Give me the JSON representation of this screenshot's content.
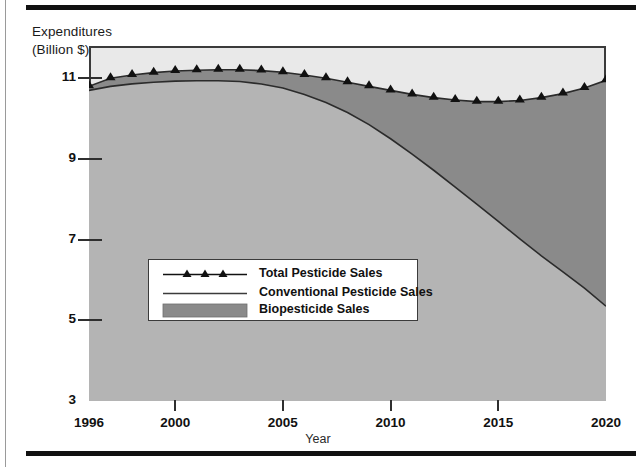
{
  "figure": {
    "y_axis_title_line1": "Expenditures",
    "y_axis_title_line2": "(Billion $)",
    "x_axis_title": "Year"
  },
  "legend": {
    "items": [
      {
        "label": "Total Pesticide Sales",
        "symbol": "line-with-triangle-markers",
        "color": "#111111"
      },
      {
        "label": "Conventional Pesticide Sales",
        "symbol": "line",
        "color": "#3b3b3b"
      },
      {
        "label": "Biopesticide Sales",
        "symbol": "filled-swatch",
        "color": "#8a8a8a"
      }
    ]
  },
  "chart_data": {
    "type": "area",
    "title": "",
    "xlabel": "Year",
    "ylabel": "Expenditures (Billion $)",
    "xlim": [
      1996,
      2020
    ],
    "ylim": [
      3,
      11.8
    ],
    "xticks": [
      1996,
      2000,
      2005,
      2010,
      2015,
      2020
    ],
    "yticks": [
      3,
      5,
      7,
      9,
      11
    ],
    "grid": false,
    "legend_position": "inside-lower-left",
    "stacked": true,
    "colors": {
      "plot_background": "#e9e9e9",
      "conventional_fill": "#b4b4b4",
      "biopesticide_fill": "#8a8a8a",
      "line": "#2b2b2b",
      "marker": "#111111"
    },
    "x": [
      1996,
      1997,
      1998,
      1999,
      2000,
      2001,
      2002,
      2003,
      2004,
      2005,
      2006,
      2007,
      2008,
      2009,
      2010,
      2011,
      2012,
      2013,
      2014,
      2015,
      2016,
      2017,
      2018,
      2019,
      2020
    ],
    "series": [
      {
        "name": "Total Pesticide Sales",
        "marker": "triangle",
        "values": [
          10.8,
          11.0,
          11.08,
          11.14,
          11.18,
          11.2,
          11.21,
          11.21,
          11.19,
          11.15,
          11.08,
          11.0,
          10.9,
          10.8,
          10.7,
          10.6,
          10.52,
          10.46,
          10.42,
          10.42,
          10.45,
          10.52,
          10.62,
          10.76,
          10.95
        ]
      },
      {
        "name": "Conventional Pesticide Sales",
        "marker": "none",
        "values": [
          10.7,
          10.8,
          10.86,
          10.9,
          10.93,
          10.94,
          10.94,
          10.92,
          10.86,
          10.76,
          10.6,
          10.4,
          10.15,
          9.85,
          9.5,
          9.12,
          8.72,
          8.3,
          7.88,
          7.45,
          7.02,
          6.6,
          6.2,
          5.8,
          5.35
        ]
      },
      {
        "name": "Biopesticide Sales",
        "marker": "none",
        "note": "band between conventional and total",
        "values": [
          0.1,
          0.2,
          0.22,
          0.24,
          0.25,
          0.26,
          0.27,
          0.29,
          0.33,
          0.39,
          0.48,
          0.6,
          0.75,
          0.95,
          1.2,
          1.48,
          1.8,
          2.16,
          2.54,
          2.97,
          3.43,
          3.92,
          4.42,
          4.96,
          5.6
        ]
      }
    ]
  }
}
